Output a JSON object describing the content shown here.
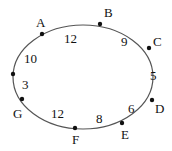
{
  "diagram": {
    "type": "ellipse-graph",
    "ellipse": {
      "cx": 83,
      "cy": 77,
      "rx": 70,
      "ry": 52,
      "stroke": "#555555"
    },
    "points": [
      {
        "id": "A",
        "label": "A",
        "x": 42,
        "y": 34,
        "lx": 36,
        "ly": 27
      },
      {
        "id": "B",
        "label": "B",
        "x": 100,
        "y": 24,
        "lx": 104,
        "ly": 17
      },
      {
        "id": "C",
        "label": "C",
        "x": 149,
        "y": 48,
        "lx": 153,
        "ly": 46
      },
      {
        "id": "P",
        "label": "",
        "x": 13,
        "y": 74,
        "lx": 0,
        "ly": 0
      },
      {
        "id": "D",
        "label": "D",
        "x": 152,
        "y": 100,
        "lx": 155,
        "ly": 113
      },
      {
        "id": "E",
        "label": "E",
        "x": 122,
        "y": 123,
        "lx": 121,
        "ly": 139
      },
      {
        "id": "F",
        "label": "F",
        "x": 75,
        "y": 128,
        "lx": 72,
        "ly": 144
      },
      {
        "id": "G",
        "label": "G",
        "x": 22,
        "y": 99,
        "lx": 13,
        "ly": 118
      }
    ],
    "segment_labels": [
      {
        "text": "12",
        "x": 64,
        "y": 43
      },
      {
        "text": "9",
        "x": 121,
        "y": 46
      },
      {
        "text": "10",
        "x": 24,
        "y": 63
      },
      {
        "text": "5",
        "x": 150,
        "y": 80
      },
      {
        "text": "3",
        "x": 22,
        "y": 89
      },
      {
        "text": "6",
        "x": 128,
        "y": 113
      },
      {
        "text": "12",
        "x": 51,
        "y": 118
      },
      {
        "text": "8",
        "x": 96,
        "y": 123
      }
    ]
  }
}
